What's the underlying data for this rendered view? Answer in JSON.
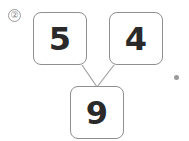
{
  "problem": {
    "number_label": "②",
    "top_left": "5",
    "top_right": "4",
    "bottom": "9"
  },
  "colors": {
    "border": "#8f8f8f",
    "text": "#2a2a2a",
    "line": "#a0a0a0"
  }
}
